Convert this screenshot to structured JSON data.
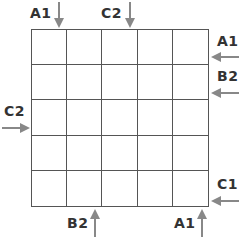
{
  "puzzle": {
    "rows": 5,
    "cols": 5,
    "cells": [
      [
        "",
        "",
        "",
        "",
        ""
      ],
      [
        "",
        "",
        "",
        "",
        ""
      ],
      [
        "",
        "",
        "",
        "",
        ""
      ],
      [
        "",
        "",
        "",
        "",
        ""
      ],
      [
        "",
        "",
        "",
        "",
        ""
      ]
    ]
  },
  "clues": {
    "top": [
      {
        "label": "A1",
        "column": 1,
        "direction": "down"
      },
      {
        "label": "C2",
        "column": 4,
        "direction": "down"
      }
    ],
    "right": [
      {
        "label": "A1",
        "row": 1,
        "direction": "left"
      },
      {
        "label": "B2",
        "row": 2,
        "direction": "left"
      },
      {
        "label": "C1",
        "row": 5,
        "direction": "left"
      }
    ],
    "left": [
      {
        "label": "C2",
        "row": 3,
        "direction": "right"
      }
    ],
    "bottom": [
      {
        "label": "B2",
        "column": 2,
        "direction": "up"
      },
      {
        "label": "A1",
        "column": 5,
        "direction": "up"
      }
    ]
  },
  "colors": {
    "grid_line": "#555555",
    "arrow": "#888888",
    "text": "#333333"
  }
}
